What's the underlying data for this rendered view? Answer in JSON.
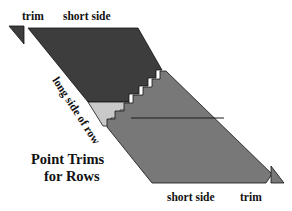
{
  "figure": {
    "title_line1": "Point Trims",
    "title_line2": "for Rows",
    "labels": {
      "trim_top": "trim",
      "short_side_top": "short side",
      "long_side_left": "long side of row",
      "long_side_right": "long side of row",
      "short_side_bottom": "short side",
      "trim_bottom": "trim"
    },
    "colors": {
      "background": "#ffffff",
      "upper_band_dark": "#3d3d3d",
      "middle_band_light": "#c9c9c9",
      "lower_band_mid": "#787878",
      "trim_top_fill": "#3d3d3d",
      "trim_bottom_fill": "#787878",
      "outline": "#111111",
      "label_text": "#111111",
      "label_text_inverse": "#ffffff"
    }
  }
}
